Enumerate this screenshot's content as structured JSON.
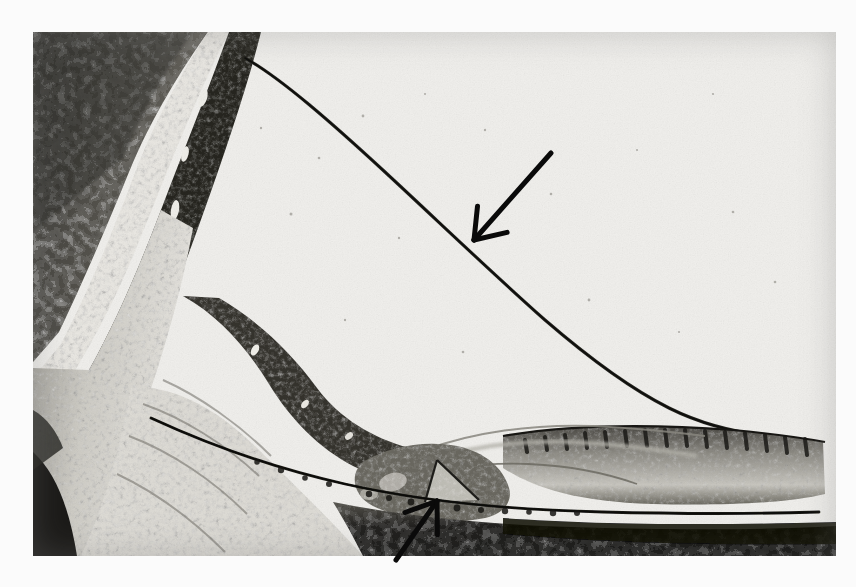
{
  "figure": {
    "kind": "photomicrograph",
    "alt_text": "Black and white histological section of the cochlea showing the scala media bounded by Reissner's membrane, the spiral ligament and bony wall at left, the stria vascularis at right, and the organ of Corti on the basilar membrane below.",
    "colors": {
      "page_background": "#fbfbfb",
      "plate_base": "#f2f2f0",
      "tissue_dark": "#2b2a28",
      "tissue_mid": "#6f6d68",
      "tissue_light": "#d8d6d1",
      "annotation_ink": "#0a0a0a"
    },
    "plate": {
      "left": 33,
      "top": 32,
      "width": 803,
      "height": 524
    }
  },
  "annotations": {
    "arrows": [
      {
        "id": "reissners-membrane-arrow",
        "label": "large arrow",
        "points_to": "Reissner's membrane",
        "direction": "down-left",
        "tail_x": 551,
        "tail_y": 153,
        "tip_x": 474,
        "tip_y": 240,
        "stroke_width": 5
      },
      {
        "id": "organ-of-corti-arrow",
        "label": "small arrow",
        "points_to": "basilar membrane and organ of Corti",
        "direction": "up-right",
        "tail_x": 396,
        "tail_y": 560,
        "tip_x": 437,
        "tip_y": 501,
        "stroke_width": 5
      }
    ]
  },
  "structures": [
    {
      "name": "otic-capsule-bone",
      "region": "upper-left",
      "tone": "dark mottled"
    },
    {
      "name": "bony-lamina-band",
      "region": "left arc",
      "tone": "very dark band"
    },
    {
      "name": "spiral-ligament",
      "region": "left-lower",
      "tone": "speckled pale"
    },
    {
      "name": "scala-media-lumen",
      "region": "center",
      "tone": "near white"
    },
    {
      "name": "reissners-membrane",
      "region": "diagonal",
      "tone": "thin dark line"
    },
    {
      "name": "stria-vascularis",
      "region": "right",
      "tone": "banded dark"
    },
    {
      "name": "organ-of-corti",
      "region": "lower-center",
      "tone": "dense clustered"
    },
    {
      "name": "basilar-membrane",
      "region": "lower band",
      "tone": "thin dark line"
    },
    {
      "name": "scala-tympani-floor",
      "region": "bottom-right",
      "tone": "dark mass"
    }
  ]
}
